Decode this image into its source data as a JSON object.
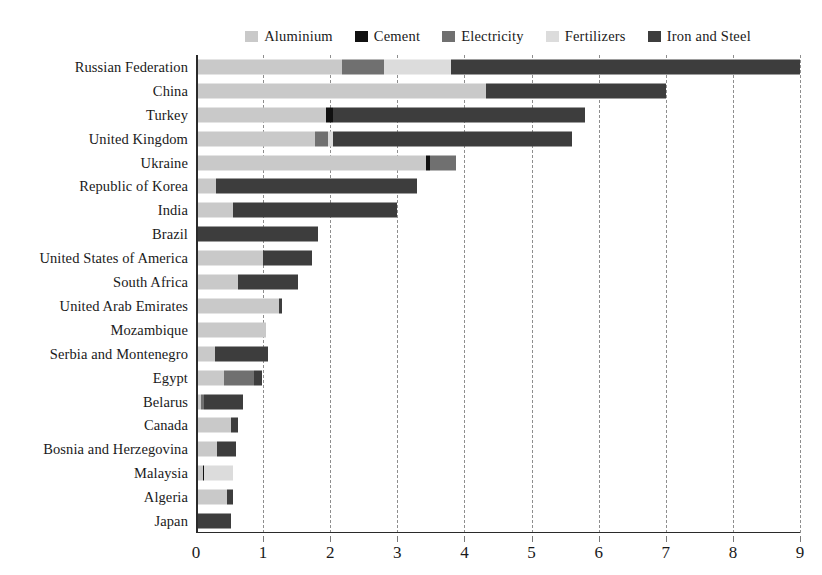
{
  "chart_data": {
    "type": "bar",
    "orientation": "horizontal",
    "stacked": true,
    "title": "",
    "xlabel": "",
    "ylabel": "",
    "xlim": [
      0,
      9
    ],
    "xticks": [
      0,
      1,
      2,
      3,
      4,
      5,
      6,
      7,
      8,
      9
    ],
    "xticklabels": [
      "0",
      "1",
      "2",
      "3",
      "4",
      "5",
      "6",
      "7",
      "8",
      "9"
    ],
    "grid": "vertical-dashed",
    "legend_position": "top-center",
    "legend": [
      "Aluminium",
      "Cement",
      "Electricity",
      "Fertilizers",
      "Iron and Steel"
    ],
    "colors": {
      "Aluminium": "#c9c9c9",
      "Cement": "#111111",
      "Electricity": "#707070",
      "Fertilizers": "#dcdcdc",
      "Iron and Steel": "#3d3d3d"
    },
    "categories": [
      "Russian Federation",
      "China",
      "Turkey",
      "United Kingdom",
      "Ukraine",
      "Republic of Korea",
      "India",
      "Brazil",
      "United States of America",
      "South Africa",
      "United Arab Emirates",
      "Mozambique",
      "Serbia and Montenegro",
      "Egypt",
      "Belarus",
      "Canada",
      "Bosnia and Herzegovina",
      "Malaysia",
      "Algeria",
      "Japan"
    ],
    "series": [
      {
        "name": "Aluminium",
        "values": [
          2.18,
          4.32,
          1.93,
          1.78,
          3.42,
          0.3,
          0.55,
          0.0,
          1.0,
          0.62,
          1.23,
          1.05,
          0.28,
          0.42,
          0.08,
          0.52,
          0.32,
          0.1,
          0.46,
          0.0
        ]
      },
      {
        "name": "Cement",
        "values": [
          0.0,
          0.0,
          0.11,
          0.0,
          0.06,
          0.0,
          0.0,
          0.0,
          0.0,
          0.0,
          0.0,
          0.0,
          0.0,
          0.0,
          0.0,
          0.0,
          0.0,
          0.02,
          0.0,
          0.0
        ]
      },
      {
        "name": "Electricity",
        "values": [
          0.62,
          0.0,
          0.0,
          0.18,
          0.4,
          0.0,
          0.0,
          0.0,
          0.0,
          0.0,
          0.0,
          0.0,
          0.0,
          0.45,
          0.04,
          0.0,
          0.0,
          0.0,
          0.0,
          0.0
        ]
      },
      {
        "name": "Fertilizers",
        "values": [
          1.0,
          0.0,
          0.0,
          0.08,
          0.0,
          0.0,
          0.0,
          0.0,
          0.0,
          0.0,
          0.0,
          0.0,
          0.0,
          0.0,
          0.0,
          0.0,
          0.0,
          0.43,
          0.0,
          0.0
        ]
      },
      {
        "name": "Iron and Steel",
        "values": [
          5.2,
          2.68,
          3.76,
          3.56,
          0.0,
          3.0,
          2.45,
          1.82,
          0.73,
          0.9,
          0.05,
          0.0,
          0.8,
          0.11,
          0.58,
          0.1,
          0.28,
          0.0,
          0.09,
          0.52
        ]
      }
    ],
    "totals": [
      9.0,
      7.0,
      5.8,
      5.6,
      3.88,
      3.3,
      3.0,
      1.82,
      1.73,
      1.52,
      1.28,
      1.05,
      1.08,
      0.98,
      0.7,
      0.62,
      0.6,
      0.55,
      0.55,
      0.52
    ]
  }
}
